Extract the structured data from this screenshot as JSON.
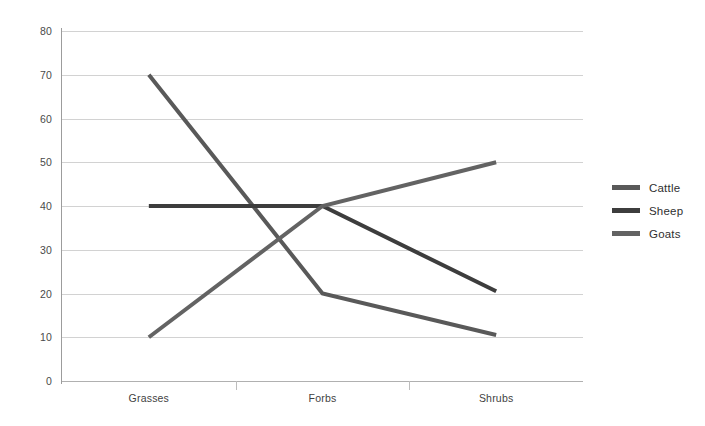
{
  "chart_data": {
    "type": "line",
    "title": "",
    "subtitle": "",
    "xlabel": "",
    "ylabel": "",
    "categories": [
      "Grasses",
      "Forbs",
      "Shrubs"
    ],
    "series": [
      {
        "name": "Cattle",
        "values": [
          70,
          20,
          10.5
        ],
        "color": "#595959"
      },
      {
        "name": "Sheep",
        "values": [
          40,
          40,
          20.5
        ],
        "color": "#3d3d3d"
      },
      {
        "name": "Goats",
        "values": [
          10,
          40,
          50
        ],
        "color": "#636363"
      }
    ],
    "ylim": [
      0,
      80
    ],
    "y_ticks": [
      0,
      10,
      20,
      30,
      40,
      50,
      60,
      70,
      80
    ],
    "y_tick_labels": [
      "0",
      "10",
      "20",
      "30",
      "40",
      "50",
      "60",
      "70",
      "80"
    ],
    "grid": true,
    "grid_axis": "y",
    "legend_position": "right",
    "line_width": 4
  },
  "legend": {
    "entries": [
      {
        "label": "Cattle",
        "color": "#595959"
      },
      {
        "label": "Sheep",
        "color": "#3d3d3d"
      },
      {
        "label": "Goats",
        "color": "#636363"
      }
    ]
  },
  "axes": {
    "y_tick_labels": [
      "80",
      "70",
      "60",
      "50",
      "40",
      "30",
      "20",
      "10",
      "0"
    ],
    "x_tick_labels": [
      "Grasses",
      "Forbs",
      "Shrubs"
    ]
  }
}
